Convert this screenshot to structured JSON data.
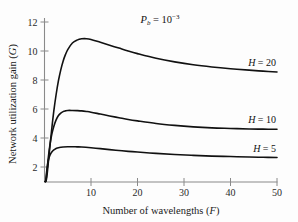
{
  "chart_data": {
    "type": "line",
    "title": "",
    "annotation": "P_b = 10^-3",
    "annotation_parts": {
      "symbol": "P",
      "subscript": "b",
      "equals": "= 10",
      "exponent": "−3"
    },
    "xlabel": "Number of wavelengths (F)",
    "xlabel_parts": {
      "text": "Number of wavelengths (",
      "italic": "F",
      "close": ")"
    },
    "ylabel": "Network utilization gain (G)",
    "ylabel_parts": {
      "text": "Network utilization gain (",
      "italic": "G",
      "close": ")"
    },
    "xlim": [
      0,
      50
    ],
    "ylim": [
      1,
      13
    ],
    "xticks": [
      10,
      20,
      30,
      40,
      50
    ],
    "yticks": [
      2,
      4,
      6,
      8,
      10,
      12
    ],
    "grid": false,
    "legend_position": "inline-right",
    "line_color": "#111111",
    "axis_color": "#8a8a8a",
    "series": [
      {
        "name": "H = 20",
        "label_parts": {
          "italic": "H",
          "value": "= 20"
        },
        "peak_x": 9,
        "peak_y": 10.85,
        "end_y": 8.55,
        "x": [
          0.35,
          0.6,
          1,
          1.5,
          2,
          2.5,
          3,
          3.5,
          4,
          4.5,
          5,
          6,
          7,
          8,
          9,
          10,
          12,
          14,
          16,
          18,
          20,
          24,
          28,
          32,
          36,
          40,
          44,
          47,
          50
        ],
        "values": [
          1.05,
          1.6,
          2.9,
          4.45,
          5.85,
          7.0,
          7.95,
          8.7,
          9.3,
          9.75,
          10.1,
          10.55,
          10.75,
          10.84,
          10.85,
          10.8,
          10.6,
          10.4,
          10.2,
          10.0,
          9.82,
          9.5,
          9.25,
          9.05,
          8.9,
          8.78,
          8.68,
          8.61,
          8.55
        ]
      },
      {
        "name": "H = 10",
        "label_parts": {
          "italic": "H",
          "value": "= 10"
        },
        "peak_x": 8,
        "peak_y": 5.9,
        "end_y": 4.6,
        "x": [
          0.3,
          0.5,
          0.8,
          1.2,
          1.6,
          2,
          2.5,
          3,
          3.5,
          4,
          4.5,
          5,
          6,
          7,
          8,
          9,
          10,
          12,
          14,
          16,
          18,
          20,
          24,
          28,
          32,
          36,
          40,
          44,
          47,
          50
        ],
        "values": [
          1.05,
          1.6,
          2.6,
          3.6,
          4.3,
          4.8,
          5.25,
          5.55,
          5.72,
          5.82,
          5.87,
          5.9,
          5.9,
          5.89,
          5.87,
          5.83,
          5.78,
          5.65,
          5.52,
          5.4,
          5.28,
          5.18,
          5.0,
          4.87,
          4.77,
          4.7,
          4.66,
          4.62,
          4.61,
          4.6
        ]
      },
      {
        "name": "H = 5",
        "label_parts": {
          "italic": "H",
          "value": "= 5"
        },
        "peak_x": 8,
        "peak_y": 3.4,
        "end_y": 2.65,
        "x": [
          0.25,
          0.4,
          0.7,
          1,
          1.4,
          1.8,
          2.2,
          2.6,
          3,
          3.5,
          4,
          5,
          6,
          7,
          8,
          10,
          12,
          14,
          16,
          18,
          20,
          24,
          28,
          32,
          36,
          40,
          44,
          47,
          50
        ],
        "values": [
          1.05,
          1.5,
          2.25,
          2.65,
          2.95,
          3.12,
          3.22,
          3.29,
          3.33,
          3.36,
          3.38,
          3.4,
          3.4,
          3.39,
          3.38,
          3.33,
          3.27,
          3.2,
          3.14,
          3.08,
          3.03,
          2.94,
          2.86,
          2.8,
          2.75,
          2.72,
          2.69,
          2.67,
          2.65
        ]
      }
    ]
  },
  "figure": {
    "background": "#fdfdfd",
    "tick_color": "#8a8a8a"
  }
}
